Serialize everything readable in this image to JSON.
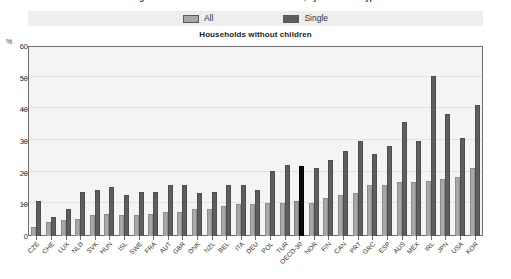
{
  "suptitle": "Figure: share of households without children, by household type",
  "legend": {
    "items": [
      {
        "label": "All",
        "color": "#a8a8a8",
        "name": "legend-all"
      },
      {
        "label": "Single",
        "color": "#5e5e5e",
        "name": "legend-single"
      }
    ]
  },
  "chart_data": {
    "type": "bar",
    "title": "Households without children",
    "subtitle": "",
    "xlabel": "",
    "ylabel": "%",
    "ylim": [
      0,
      60
    ],
    "yticks": [
      0,
      10,
      20,
      30,
      40,
      50,
      60
    ],
    "grid": true,
    "legend_position": "top-center",
    "highlight_category": "OECD-30",
    "highlight_color": "#0a0a0a",
    "categories": [
      "CZE",
      "CHE",
      "LUX",
      "NLD",
      "SVK",
      "HUN",
      "ISL",
      "SWE",
      "FRA",
      "AUT",
      "GBR",
      "DNK",
      "NZL",
      "BEL",
      "ITA",
      "DEU",
      "POL",
      "TUR",
      "OECD-30",
      "NOR",
      "FIN",
      "CAN",
      "PRT",
      "GRC",
      "ESP",
      "AUS",
      "MEX",
      "IRL",
      "JPN",
      "USA",
      "KOR"
    ],
    "series": [
      {
        "name": "All",
        "color": "#a8a8a8",
        "values": [
          3.0,
          4.5,
          5.0,
          5.5,
          6.5,
          7.0,
          6.5,
          6.5,
          7.0,
          7.5,
          7.5,
          8.5,
          8.5,
          9.5,
          10.0,
          10.0,
          10.5,
          10.5,
          11.0,
          10.5,
          12.0,
          13.0,
          13.5,
          16.0,
          16.0,
          17.0,
          17.0,
          17.5,
          18.0,
          18.5,
          21.5
        ]
      },
      {
        "name": "Single",
        "color": "#5e5e5e",
        "values": [
          11.0,
          6.0,
          8.5,
          14.0,
          14.5,
          15.5,
          13.0,
          14.0,
          14.0,
          16.0,
          16.0,
          13.5,
          14.0,
          16.0,
          16.0,
          14.5,
          20.5,
          22.5,
          22.0,
          21.5,
          24.0,
          27.0,
          30.0,
          26.0,
          28.5,
          36.0,
          30.0,
          50.5,
          38.5,
          31.0,
          41.5
        ]
      }
    ]
  }
}
